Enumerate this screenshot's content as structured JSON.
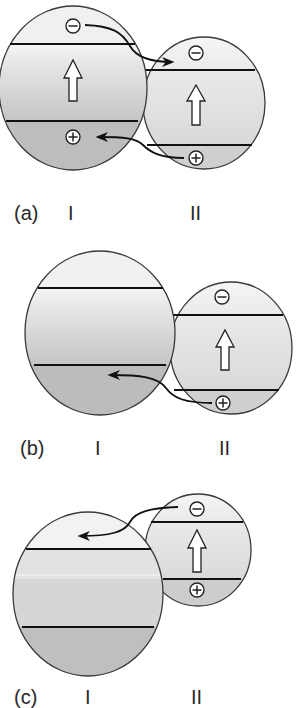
{
  "figure": {
    "panels": [
      {
        "id": "a",
        "label": "(a)",
        "system_labels": [
          "I",
          "II"
        ],
        "description": "Both I and II excited; electron transfers from I's upper level to II's upper band, hole from II's lower level to I's lower band",
        "transfers": [
          "electron: I -> II",
          "hole: II -> I"
        ]
      },
      {
        "id": "b",
        "label": "(b)",
        "system_labels": [
          "I",
          "II"
        ],
        "description": "Only II excited; hole transfers from II to I",
        "transfers": [
          "hole: II -> I"
        ]
      },
      {
        "id": "c",
        "label": "(c)",
        "system_labels": [
          "I",
          "II"
        ],
        "description": "Only II excited; electron transfers from II to I",
        "transfers": [
          "electron: II -> I"
        ]
      }
    ],
    "symbols": {
      "electron": "−",
      "hole": "+"
    },
    "colors": {
      "outline": "#3a3a3a",
      "band_line": "#111111",
      "top_fill": "#efefef",
      "mid_fill": "#d9d9d9",
      "bottom_fill": "#b9b9b9",
      "label": "#2a2a2a"
    }
  }
}
